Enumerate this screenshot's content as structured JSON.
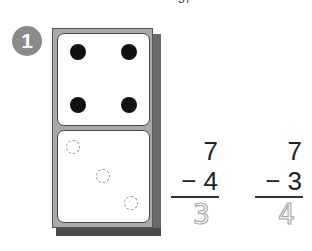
{
  "page_fragment": "37",
  "problem": {
    "number": "1",
    "domino": {
      "top_dots": 4,
      "bottom_traced_dots": 3
    },
    "subtraction_1": {
      "minuend": "7",
      "subtrahend": "− 4",
      "answer": "3"
    },
    "subtraction_2": {
      "minuend": "7",
      "subtrahend": "− 3",
      "answer": "4"
    }
  }
}
